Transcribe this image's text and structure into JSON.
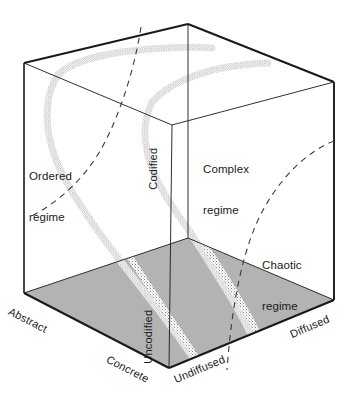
{
  "figure": {
    "type": "3d-cube-conceptual-diagram",
    "background_color": "#ffffff",
    "line_color": "#1a1a1a",
    "floor_fill_color": "#b3b3b3",
    "band_color": "#9a9a9a",
    "dashed_color": "#3a3a3a"
  },
  "axes": [
    {
      "id": "axis-codification",
      "low_label": "Uncodified",
      "high_label": "Codified",
      "orientation": "vertical"
    },
    {
      "id": "axis-abstraction",
      "low_label": "Concrete",
      "high_label": "Abstract",
      "orientation": "depth-left"
    },
    {
      "id": "axis-diffusion",
      "low_label": "Undiffused",
      "high_label": "Diffused",
      "orientation": "depth-right"
    }
  ],
  "axis_labels": {
    "abstract": "Abstract",
    "concrete": "Concrete",
    "undiffused": "Undiffused",
    "diffused": "Diffused",
    "codified": "Codified",
    "uncodified": "Uncodified"
  },
  "regions": [
    {
      "id": "ordered",
      "line1": "Ordered",
      "line2": "regime"
    },
    {
      "id": "complex",
      "line1": "Complex",
      "line2": "regime"
    },
    {
      "id": "chaotic",
      "line1": "Chaotic",
      "line2": "regime"
    }
  ],
  "regime_labels": {
    "ordered_line1": "Ordered",
    "ordered_line2": "regime",
    "complex_line1": "Complex",
    "complex_line2": "regime",
    "chaotic_line1": "Chaotic",
    "chaotic_line2": "regime"
  }
}
